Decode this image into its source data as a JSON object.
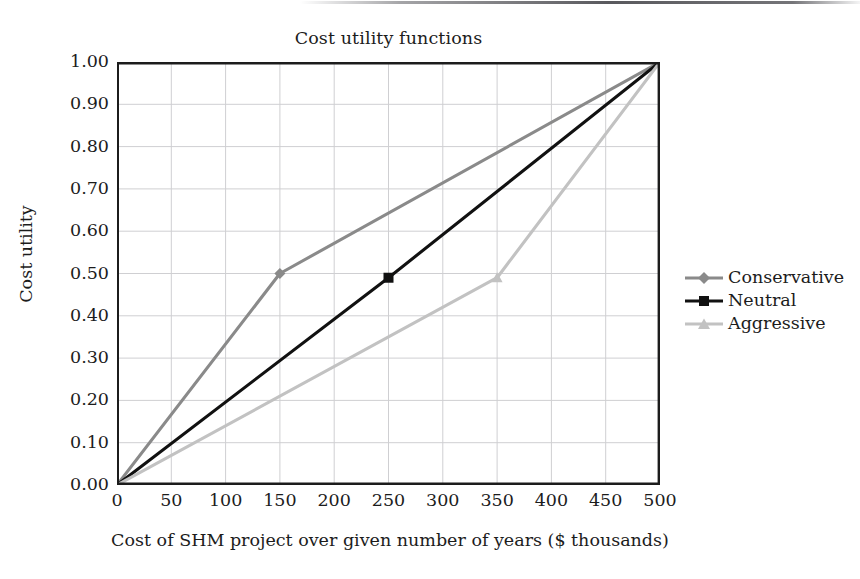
{
  "chart_data": {
    "type": "line",
    "title": "Cost utility functions",
    "xlabel": "Cost of SHM project over given number of years ($ thousands)",
    "ylabel": "Cost utility",
    "xlim": [
      0,
      500
    ],
    "ylim": [
      0,
      1
    ],
    "grid": true,
    "legend_position": "right",
    "xticks": [
      "0",
      "50",
      "100",
      "150",
      "200",
      "250",
      "300",
      "350",
      "400",
      "450",
      "500"
    ],
    "yticks": [
      "0.00",
      "0.10",
      "0.20",
      "0.30",
      "0.40",
      "0.50",
      "0.60",
      "0.70",
      "0.80",
      "0.90",
      "1.00"
    ],
    "series": [
      {
        "name": "Conservative",
        "color": "#8a8a8a",
        "marker": "diamond",
        "x": [
          0,
          150,
          500
        ],
        "y": [
          0.0,
          0.5,
          1.0
        ]
      },
      {
        "name": "Neutral",
        "color": "#111111",
        "marker": "square",
        "x": [
          0,
          250,
          500
        ],
        "y": [
          0.0,
          0.49,
          1.0
        ]
      },
      {
        "name": "Aggressive",
        "color": "#c2c2c2",
        "marker": "triangle",
        "x": [
          0,
          350,
          500
        ],
        "y": [
          0.0,
          0.49,
          1.0
        ]
      }
    ]
  },
  "legend": {
    "entries": [
      {
        "label": "Conservative"
      },
      {
        "label": "Neutral"
      },
      {
        "label": "Aggressive"
      }
    ]
  },
  "colors": {
    "axis": "#1c1c1c",
    "grid": "#cfcfd2",
    "background": "#ffffff"
  }
}
